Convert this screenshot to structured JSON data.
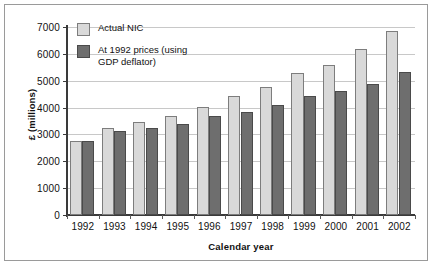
{
  "chart_data": {
    "type": "bar",
    "title": "",
    "xlabel": "Calendar year",
    "ylabel": "£ (millions)",
    "ylim": [
      0,
      7000
    ],
    "ytick_step": 1000,
    "ytick_labels": [
      "7000",
      "6000",
      "5000",
      "4000",
      "3000",
      "2000",
      "1000",
      "0"
    ],
    "ytick_values": [
      7000,
      6000,
      5000,
      4000,
      3000,
      2000,
      1000,
      0
    ],
    "grid": "horizontal",
    "legend_position": "inside top-left",
    "categories": [
      "1992",
      "1993",
      "1994",
      "1995",
      "1996",
      "1997",
      "1998",
      "1999",
      "2000",
      "2001",
      "2002"
    ],
    "series": [
      {
        "name": "Actual NIC",
        "color": "#d9d9d9",
        "values": [
          2750,
          3250,
          3480,
          3690,
          4030,
          4450,
          4750,
          5290,
          5580,
          6170,
          6870
        ]
      },
      {
        "name": "At 1992 prices (using\nGDP deflator)",
        "color": "#6e6e6e",
        "values": [
          2750,
          3130,
          3250,
          3380,
          3690,
          3840,
          4080,
          4450,
          4630,
          4870,
          5330
        ]
      }
    ]
  },
  "colors": {
    "series_light": "#d9d9d9",
    "series_dark": "#6e6e6e",
    "gridline": "#c8c8c8",
    "axis": "#3a3a3a",
    "frame": "#9a9a9a",
    "background": "#ffffff",
    "text": "#111111"
  }
}
